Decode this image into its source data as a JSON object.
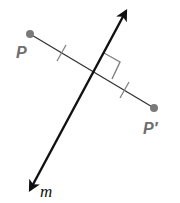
{
  "figure": {
    "labels": {
      "point_p": "P",
      "point_p_prime": "P′",
      "line_m": "m"
    },
    "colors": {
      "line_m": "#111111",
      "segment": "#333333",
      "points": "#7a7a7a",
      "point_labels": "#6e6e6e",
      "marks": "#808080"
    },
    "points": {
      "P": [
        30,
        34
      ],
      "P_prime": [
        154,
        108
      ],
      "intersection": [
        93,
        71
      ],
      "line_m_top_arrow": [
        129,
        5
      ],
      "line_m_bottom_arrow": [
        25,
        197
      ]
    },
    "annotations": {
      "congruent_tick_marks": 2,
      "right_angle_marker": true
    }
  }
}
